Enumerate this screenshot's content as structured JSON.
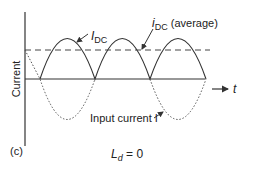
{
  "diagram": {
    "panel_label": "(c)",
    "y_axis_label": "Current",
    "x_axis_label": "t",
    "curves": {
      "rectified": {
        "label_main": "I",
        "label_sub": "DC",
        "style": "solid"
      },
      "average": {
        "label_main": "i",
        "label_sub": "DC",
        "label_suffix": " (average)",
        "style": "dashed"
      },
      "input": {
        "label": "Input current I",
        "style": "dotted"
      }
    },
    "caption": {
      "main": "L",
      "sub": "d",
      "suffix": " = 0"
    }
  },
  "colors": {
    "line": "#333333",
    "background": "#ffffff"
  }
}
